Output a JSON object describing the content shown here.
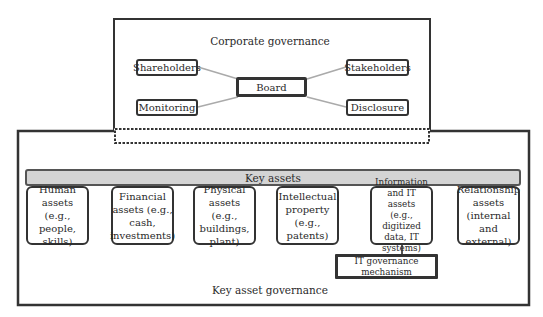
{
  "corporate_governance": {
    "title": "Corporate governance",
    "center": "Board",
    "nodes": {
      "shareholders": "Shareholders",
      "stakeholders": "Stakeholders",
      "monitoring": "Monitoring",
      "disclosure": "Disclosure"
    }
  },
  "key_asset_governance": {
    "title": "Key asset governance",
    "bar_label": "Key assets",
    "bar_color": "#d4d4d4",
    "assets": [
      {
        "label": "Human\nassets (e.g.,\npeople, skills)"
      },
      {
        "label": "Financial\nassets (e.g.,\ncash,\ninvestments)"
      },
      {
        "label": "Physical\nassets (e.g.,\nbuildings,\nplant)"
      },
      {
        "label": "Intellectual\nproperty\n(e.g., patents)"
      },
      {
        "label": "Information\nand IT assets\n(e.g., digitized\ndata, IT\nsystems)"
      },
      {
        "label": "Relationship\nassets\n(internal and\nexternal)"
      }
    ],
    "it_mechanism": "IT governance\nmechanism"
  }
}
